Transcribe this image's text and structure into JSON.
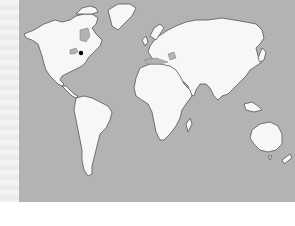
{
  "map": {
    "type": "world-outline",
    "colors": {
      "ocean": "#b3b3b3",
      "land": "#f7f7f7",
      "coast": "#555555",
      "marker": "#000000"
    },
    "marker": {
      "label": "",
      "region": "North America - Great Lakes / Ontario",
      "x": 81,
      "y": 53
    }
  }
}
